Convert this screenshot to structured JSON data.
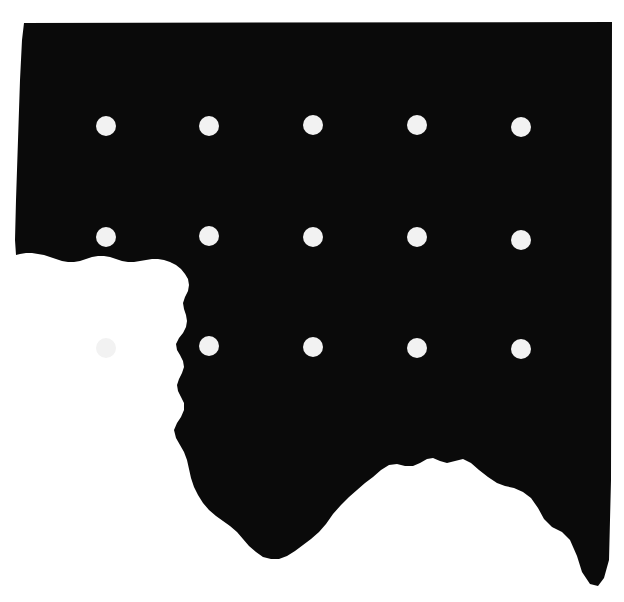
{
  "canvas": {
    "width": 624,
    "height": 602,
    "background_color": "#ffffff"
  },
  "figure": {
    "type": "map-silhouette",
    "name": "region-outline",
    "fill_color": "#0a0a0a",
    "description": "Solid black silhouette of a geographic region with a straight top edge, a near-vertical left edge, a straight right edge, and an irregular jagged southern boundary forming a large notch in the lower-left and a rounded bay in the lower-right.",
    "bounds": {
      "left": 14,
      "top": 22,
      "right": 613,
      "bottom": 586
    },
    "outline_path": "M 24,23 L 612,22 L 611,480 L 609,560 L 604,578 L 598,586 L 590,584 L 582,572 L 577,556 L 570,540 L 562,532 L 552,527 L 544,519 L 538,508 L 531,498 L 523,492 L 514,488 L 505,486 L 497,483 L 488,477 L 479,470 L 471,463 L 463,459 L 455,461 L 447,463 L 440,461 L 433,458 L 427,459 L 420,463 L 413,466 L 405,466 L 397,464 L 389,465 L 381,470 L 373,477 L 365,483 L 357,490 L 349,497 L 341,505 L 333,514 L 326,524 L 319,532 L 311,539 L 303,545 L 295,551 L 287,556 L 279,559 L 271,559 L 263,557 L 256,552 L 249,546 L 243,539 L 237,532 L 230,526 L 223,521 L 216,516 L 209,510 L 203,503 L 198,495 L 194,487 L 191,478 L 189,469 L 187,460 L 184,452 L 180,445 L 176,438 L 174,430 L 177,423 L 181,417 L 184,410 L 184,403 L 181,397 L 178,391 L 177,385 L 179,379 L 182,373 L 184,367 L 183,361 L 180,355 L 177,350 L 176,344 L 179,338 L 183,333 L 186,327 L 187,321 L 186,315 L 184,309 L 183,303 L 185,297 L 188,291 L 189,285 L 188,279 L 185,274 L 181,269 L 176,265 L 170,262 L 164,260 L 158,259 L 152,259 L 146,260 L 140,261 L 134,262 L 128,262 L 122,261 L 116,259 L 110,257 L 104,256 L 98,256 L 92,257 L 86,259 L 80,261 L 74,262 L 68,262 L 62,261 L 56,259 L 50,257 L 44,255 L 38,254 L 32,253 L 26,253 L 20,254 L 16,255 L 15,240 L 16,200 L 18,140 L 20,80 L 22,40 Z",
    "south_boundary_note": "irregular coastline-like edge"
  },
  "dots": {
    "name": "marker-dot-grid",
    "color": "#f2f2f2",
    "radius": 10,
    "rows": 3,
    "columns": 5,
    "row_y": [
      126,
      237,
      348
    ],
    "col_x": [
      106,
      209,
      313,
      417,
      521
    ],
    "count": 15,
    "points": [
      {
        "id": "dot-r1-c1",
        "x": 106,
        "y": 126
      },
      {
        "id": "dot-r1-c2",
        "x": 209,
        "y": 126
      },
      {
        "id": "dot-r1-c3",
        "x": 313,
        "y": 125
      },
      {
        "id": "dot-r1-c4",
        "x": 417,
        "y": 125
      },
      {
        "id": "dot-r1-c5",
        "x": 521,
        "y": 127
      },
      {
        "id": "dot-r2-c1",
        "x": 106,
        "y": 237
      },
      {
        "id": "dot-r2-c2",
        "x": 209,
        "y": 236
      },
      {
        "id": "dot-r2-c3",
        "x": 313,
        "y": 237
      },
      {
        "id": "dot-r2-c4",
        "x": 417,
        "y": 237
      },
      {
        "id": "dot-r2-c5",
        "x": 521,
        "y": 240
      },
      {
        "id": "dot-r3-c1",
        "x": 106,
        "y": 348
      },
      {
        "id": "dot-r3-c2",
        "x": 209,
        "y": 346
      },
      {
        "id": "dot-r3-c3",
        "x": 313,
        "y": 347
      },
      {
        "id": "dot-r3-c4",
        "x": 417,
        "y": 348
      },
      {
        "id": "dot-r3-c5",
        "x": 521,
        "y": 349
      }
    ]
  }
}
